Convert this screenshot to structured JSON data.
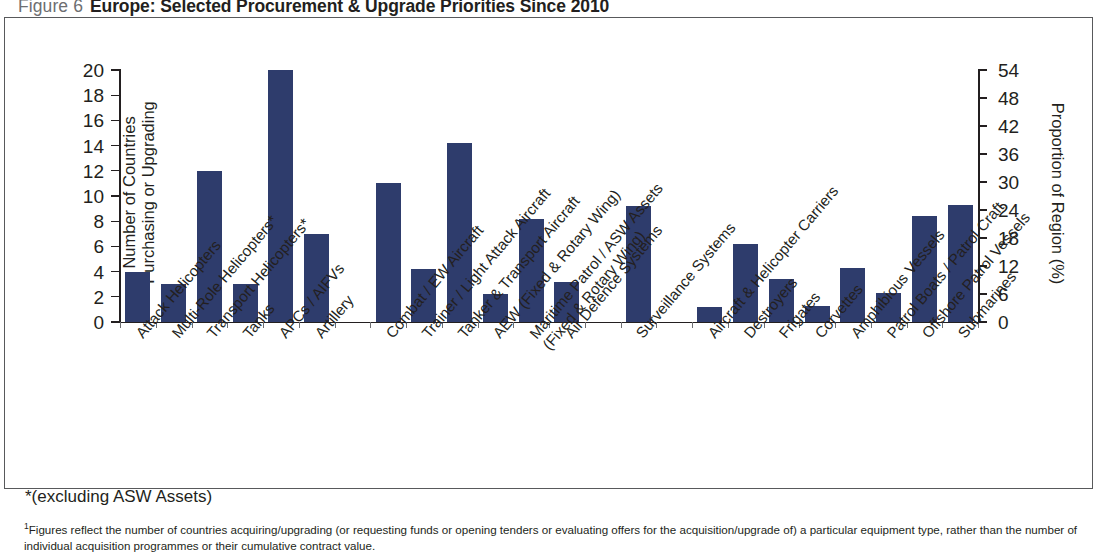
{
  "figure": {
    "number": "Figure 6",
    "title": "Europe: Selected Procurement & Upgrade Priorities Since 2010"
  },
  "notes": {
    "asterisk": "*(excluding ASW Assets)",
    "footnote_marker": "1",
    "footnote": "Figures reflect the number of countries acquiring/upgrading (or requesting funds or opening tenders or evaluating offers for the acquisition/upgrade of) a particular equipment type, rather than the number of individual acquisition programmes or their cumulative contract value."
  },
  "chart_data": {
    "type": "bar",
    "title": "Europe: Selected Procurement & Upgrade Priorities Since 2010",
    "xlabel": "",
    "ylabel": "Number of Countries Purchasing or Upgrading",
    "y2label": "Proportion of Region (%)",
    "ylim": [
      0,
      20
    ],
    "y2lim": [
      0,
      54
    ],
    "yticks": [
      0,
      2,
      4,
      6,
      8,
      10,
      12,
      14,
      16,
      18,
      20
    ],
    "y2ticks": [
      0,
      6,
      12,
      18,
      24,
      30,
      36,
      42,
      48,
      54
    ],
    "grid": false,
    "legend": "none",
    "bar_color": "#2e3c6c",
    "categories": [
      "Attack Helicopters",
      "Multi-Role Helicopters*",
      "Transport Helicopters*",
      "Tanks",
      "APCs / AIFVs",
      "Artillery",
      "Combat / EW Aircraft",
      "Trainer / Light Attack Aircraft",
      "Tanker & Transport Aircraft",
      "AEW (Fixed & Rotary Wing)",
      "Maritime Patrol / ASW Assets (Fixed & Rotary Wing)",
      "Air Defence Systems",
      "Surveillance Systems",
      "Aircraft & Helicopter Carriers",
      "Destroyers",
      "Frigates",
      "Corvettes",
      "Amphibious Vessels",
      "Patrol Boats / Patrol Craft",
      "Offshore Patrol Vessels",
      "Submarines"
    ],
    "values": [
      4,
      3,
      12,
      3,
      20,
      7,
      11,
      4.2,
      14.2,
      2.2,
      8.2,
      3.2,
      9.2,
      1.2,
      6.2,
      3.4,
      1.3,
      4.3,
      2.3,
      8.4,
      9.3
    ],
    "values_percent": [
      10.8,
      8.1,
      32.4,
      8.1,
      54,
      18.9,
      29.7,
      11.3,
      38.3,
      5.9,
      22.1,
      8.6,
      24.8,
      3.2,
      16.7,
      9.2,
      3.5,
      11.6,
      6.2,
      22.7,
      25.1
    ]
  }
}
